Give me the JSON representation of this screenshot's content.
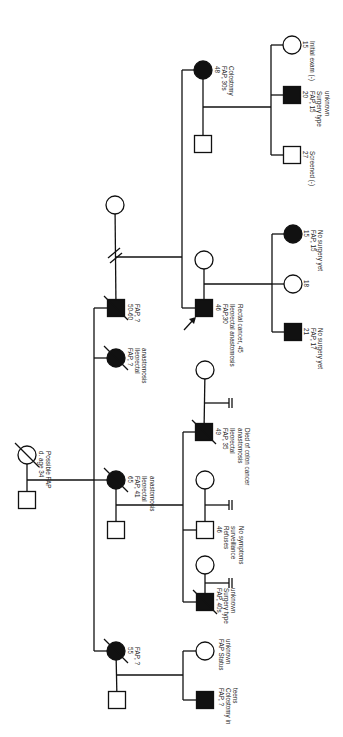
{
  "diagram": {
    "type": "pedigree",
    "condition": "FAP",
    "orientation": "rotated-90",
    "individuals": [
      {
        "id": "I-1",
        "sex": "female",
        "affected": false,
        "deceased": true,
        "lines": [
          "d. age 34",
          "Possible FAP"
        ]
      },
      {
        "id": "I-2",
        "sex": "male",
        "affected": false,
        "deceased": false,
        "lines": []
      },
      {
        "id": "II-1",
        "sex": "male",
        "affected": true,
        "deceased": true,
        "lines": [
          "50-60",
          "FAP, ?"
        ]
      },
      {
        "id": "II-1s",
        "sex": "female",
        "affected": false,
        "deceased": false,
        "lines": [],
        "relationship": "divorced"
      },
      {
        "id": "II-2",
        "sex": "female",
        "affected": true,
        "deceased": true,
        "lines": [
          "FAP, ?",
          "Ileorectal",
          "anastomosis"
        ]
      },
      {
        "id": "II-3",
        "sex": "female",
        "affected": true,
        "deceased": true,
        "lines": [
          "65",
          "FAP, 41",
          "Ileorectal",
          "anastomosis"
        ]
      },
      {
        "id": "II-3s",
        "sex": "male",
        "affected": false,
        "deceased": false,
        "lines": []
      },
      {
        "id": "II-4",
        "sex": "female",
        "affected": true,
        "deceased": true,
        "lines": [
          "55",
          "FAP, ?"
        ]
      },
      {
        "id": "II-4s",
        "sex": "male",
        "affected": false,
        "deceased": false,
        "lines": []
      },
      {
        "id": "III-1",
        "sex": "female",
        "affected": true,
        "deceased": false,
        "lines": [
          "48",
          "FAP, 30s",
          "Colostomy"
        ]
      },
      {
        "id": "III-1s",
        "sex": "male",
        "affected": false,
        "deceased": false,
        "lines": []
      },
      {
        "id": "III-2",
        "sex": "male",
        "affected": true,
        "deceased": false,
        "proband": true,
        "lines": [
          "46",
          "FAP,30",
          "Ileorectal anastomosis",
          "Rectal cancer, 45"
        ]
      },
      {
        "id": "III-2s",
        "sex": "female",
        "affected": false,
        "deceased": false,
        "lines": []
      },
      {
        "id": "III-3",
        "sex": "male",
        "affected": true,
        "deceased": true,
        "lines": [
          "49",
          "FAP, 35",
          "Ileorectal",
          "anastomosis",
          "Died of colon cancer"
        ]
      },
      {
        "id": "III-3s",
        "sex": "female",
        "affected": false,
        "deceased": false,
        "lines": [],
        "no_children": true
      },
      {
        "id": "III-4",
        "sex": "male",
        "affected": false,
        "deceased": false,
        "lines": [
          "46",
          "Refuses",
          "surveillance",
          "No symptoms"
        ]
      },
      {
        "id": "III-4s",
        "sex": "female",
        "affected": false,
        "deceased": false,
        "lines": [],
        "no_children": true
      },
      {
        "id": "III-5",
        "sex": "male",
        "affected": true,
        "deceased": true,
        "lines": [
          "FAP, 40s",
          "Surgery type",
          "unknown"
        ]
      },
      {
        "id": "III-5s",
        "sex": "female",
        "affected": false,
        "deceased": false,
        "lines": [],
        "no_children": true
      },
      {
        "id": "III-6",
        "sex": "female",
        "affected": false,
        "deceased": false,
        "lines": [
          "FAP Status",
          "unknown"
        ]
      },
      {
        "id": "III-7",
        "sex": "male",
        "affected": true,
        "deceased": false,
        "lines": [
          "FAP, ?",
          "Colostomy in",
          "teens"
        ]
      },
      {
        "id": "IV-1",
        "sex": "female",
        "affected": false,
        "deceased": false,
        "lines": [
          "15",
          "Initial exam (-)"
        ]
      },
      {
        "id": "IV-2",
        "sex": "male",
        "affected": true,
        "deceased": false,
        "lines": [
          "20",
          "FAP, 15",
          "Surgery type",
          "unknown"
        ]
      },
      {
        "id": "IV-3",
        "sex": "male",
        "affected": false,
        "deceased": false,
        "lines": [
          "27",
          "Screened (-)"
        ]
      },
      {
        "id": "IV-4",
        "sex": "female",
        "affected": true,
        "deceased": false,
        "lines": [
          "15",
          "FAP, 15",
          "No surgery yet"
        ]
      },
      {
        "id": "IV-5",
        "sex": "female",
        "affected": false,
        "deceased": false,
        "lines": [
          "18"
        ]
      },
      {
        "id": "IV-6",
        "sex": "male",
        "affected": true,
        "deceased": false,
        "lines": [
          "21",
          "FAP, 17",
          "No surgery yet"
        ]
      }
    ]
  }
}
